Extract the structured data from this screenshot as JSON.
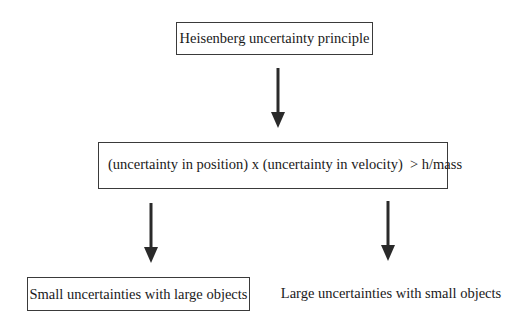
{
  "diagram": {
    "type": "flowchart",
    "nodes": [
      {
        "id": "principle",
        "label": "Heisenberg uncertainty principle",
        "bordered": true
      },
      {
        "id": "relation",
        "label": "(uncertainty in position) x (uncertainty in velocity)  > h/mass",
        "bordered": true
      },
      {
        "id": "small",
        "label": "Small uncertainties with large objects",
        "bordered": true
      },
      {
        "id": "large",
        "label": "Large uncertainties with small objects",
        "bordered": false
      }
    ],
    "edges": [
      {
        "from": "principle",
        "to": "relation"
      },
      {
        "from": "relation",
        "to": "small"
      },
      {
        "from": "relation",
        "to": "large"
      }
    ],
    "colors": {
      "line": "#2a2a2a",
      "background": "#ffffff"
    }
  }
}
